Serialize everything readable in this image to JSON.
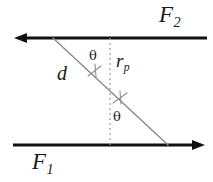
{
  "figure": {
    "type": "geometry-diagram",
    "background_color": "#ffffff",
    "width": 213,
    "height": 182
  },
  "colors": {
    "line_primary": "#111111",
    "line_secondary": "#8a8a8a",
    "dotted_line": "#9a9a9a",
    "text": "#1a1a1a"
  },
  "labels": {
    "top_line": "F",
    "top_line_sub": "2",
    "bottom_line": "F",
    "bottom_line_sub": "1",
    "perpendicular": "r",
    "perpendicular_sub": "p",
    "separation": "d",
    "angle_upper": "θ",
    "angle_lower": "θ"
  },
  "geometry": {
    "top_line": {
      "name": "F2",
      "x1": 207,
      "y1": 38,
      "x2": 16,
      "y2": 38,
      "arrow": "left",
      "stroke_width": 3.2
    },
    "bottom_line": {
      "name": "F1",
      "x1": 13,
      "y1": 145,
      "x2": 203,
      "y2": 145,
      "arrow": "right",
      "stroke_width": 3.2
    },
    "diagonal": {
      "name": "slant-line",
      "x1": 53,
      "y1": 38,
      "x2": 168,
      "y2": 145,
      "stroke_width": 1.3
    },
    "dotted_vertical": {
      "name": "perpendicular-rp",
      "x": 110,
      "y1": 38,
      "y2": 145,
      "stroke_width": 1.2,
      "dash": "2 3"
    },
    "tick_upper": {
      "cx": 95,
      "cy": 73,
      "label": "angle-tick-upper"
    },
    "tick_lower": {
      "cx": 120,
      "cy": 100,
      "label": "angle-tick-lower"
    }
  }
}
